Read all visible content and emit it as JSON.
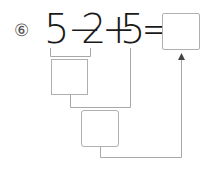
{
  "problem": {
    "number_label": "⑥",
    "tokens": [
      "5",
      "−",
      "2",
      "+",
      "5",
      "="
    ],
    "answer_box_value": "",
    "step1_box_value": "",
    "step2_box_value": ""
  },
  "colors": {
    "text": "#1a1a1a",
    "lines": "#a8a8a8",
    "box_border": "#b0b0b0"
  }
}
